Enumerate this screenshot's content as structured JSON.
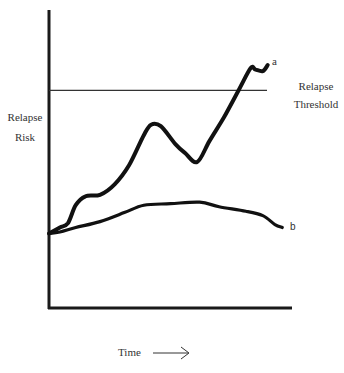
{
  "chart_data": {
    "type": "line",
    "title": "",
    "xlabel": "Time",
    "ylabel": "Relapse Risk",
    "ylabel_lines": [
      "Relapse",
      "Risk"
    ],
    "x_arrow": "⟶",
    "grid": false,
    "legend": "inline labels at series ends",
    "x_range": [
      0,
      100
    ],
    "y_range": [
      0,
      100
    ],
    "threshold": {
      "label": "Relapse Threshold",
      "label_lines": [
        "Relapse",
        "Threshold"
      ],
      "value": 73
    },
    "series": [
      {
        "name": "a",
        "x": [
          0,
          4.5,
          7.8,
          11,
          15,
          21,
          27,
          33,
          39,
          42,
          46,
          52,
          56,
          61,
          66,
          72,
          78,
          83,
          85,
          88,
          90
        ],
        "y": [
          25,
          27,
          28.5,
          34.5,
          37.5,
          38,
          41.5,
          48,
          58,
          61.5,
          61,
          55,
          52,
          49,
          56,
          64,
          73,
          80.5,
          80,
          79.5,
          81.5
        ],
        "end_label": "a"
      },
      {
        "name": "b",
        "x": [
          0,
          4.5,
          11,
          21,
          31,
          39,
          50,
          62,
          70,
          81,
          88,
          93,
          96
        ],
        "y": [
          25,
          25.5,
          27,
          29,
          32,
          34.5,
          35,
          35.5,
          34,
          32.5,
          31,
          28,
          27
        ],
        "end_label": "b"
      }
    ]
  },
  "labels": {
    "y_line1": "Relapse",
    "y_line2": "Risk",
    "threshold_line1": "Relapse",
    "threshold_line2": "Threshold",
    "series_a": "a",
    "series_b": "b",
    "x_label": "Time"
  }
}
